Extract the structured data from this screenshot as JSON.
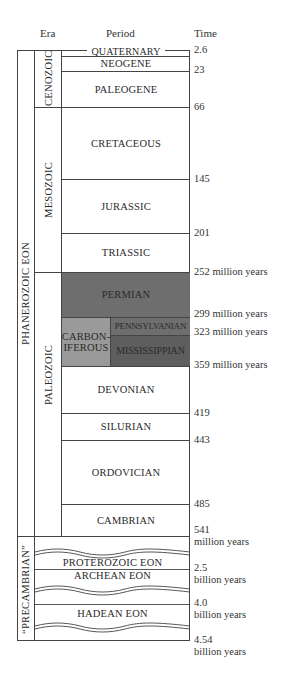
{
  "headers": {
    "era": "Era",
    "period": "Period",
    "time": "Time"
  },
  "eons": {
    "phanerozoic": "PHANEROZOIC EON",
    "precambrian": "“PRECAMBRIAN”"
  },
  "eras": {
    "cenozoic": "CENOZOIC",
    "mesozoic": "MESOZOIC",
    "paleozoic": "PALEOZOIC"
  },
  "periods": {
    "quaternary": "QUATERNARY",
    "neogene": "NEOGENE",
    "paleogene": "PALEOGENE",
    "cretaceous": "CRETACEOUS",
    "jurassic": "JURASSIC",
    "triassic": "TRIASSIC",
    "permian": "PERMIAN",
    "carboniferous_1": "CARBON-",
    "carboniferous_2": "IFEROUS",
    "pennsylvanian": "PENNSYLVANIAN",
    "mississippian": "MISSISSIPPIAN",
    "devonian": "DEVONIAN",
    "silurian": "SILURIAN",
    "ordovician": "ORDOVICIAN",
    "cambrian": "CAMBRIAN"
  },
  "precambrian_eons": {
    "proterozoic": "PROTEROZOIC EON",
    "archean": "ARCHEAN EON",
    "hadean": "HADEAN EON"
  },
  "times": {
    "t_2_6": "2.6",
    "t_23": "23",
    "t_66": "66",
    "t_145": "145",
    "t_201": "201",
    "t_252": "252 million years",
    "t_299": "299 million years",
    "t_323": "323 million years",
    "t_359": "359 million years",
    "t_419": "419",
    "t_443": "443",
    "t_485": "485",
    "t_541": "541",
    "t_541_unit": "million years",
    "t_2_5": "2.5",
    "t_2_5_unit": "billion years",
    "t_4_0": "4.0",
    "t_4_0_unit": "billion years",
    "t_4_54": "4.54",
    "t_4_54_unit": "billion years"
  },
  "colors": {
    "permian": "#6e6e6e",
    "carboniferous": "#9a9a9a",
    "pennsylvanian": "#6e6e6e",
    "mississippian": "#5e5e5e",
    "line": "#444444"
  }
}
